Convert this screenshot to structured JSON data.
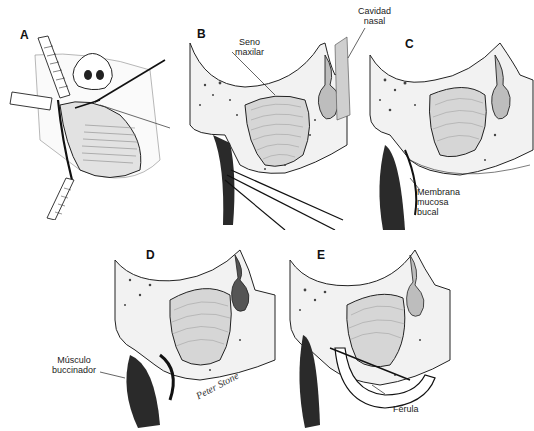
{
  "figure": {
    "panels": [
      {
        "id": "A",
        "letter": "A",
        "description": "Surgical view of maxillary vestibule with retractors and instrument"
      },
      {
        "id": "B",
        "letter": "B",
        "description": "Coronal section, forceps at vestibule"
      },
      {
        "id": "C",
        "letter": "C",
        "description": "Coronal section, mucosal flap"
      },
      {
        "id": "D",
        "letter": "D",
        "description": "Coronal section, buccinator muscle"
      },
      {
        "id": "E",
        "letter": "E",
        "description": "Coronal section with splint"
      }
    ],
    "labels": {
      "seno_maxilar": "Seno\nmaxilar",
      "cavidad_nasal": "Cavidad\nnasal",
      "membrana_mucosa_bucal": "Membrana\nmucosa\nbucal",
      "musculo_buccinador": "Músculo\nbuccinador",
      "ferula": "Férula"
    },
    "signature": "Peter Stone",
    "colors": {
      "ink": "#1a1a1a",
      "bone_fill": "#f2f2f2",
      "sinus_fill": "#d6d6d6",
      "dark_tissue": "#2a2a2a",
      "background": "#ffffff"
    }
  }
}
